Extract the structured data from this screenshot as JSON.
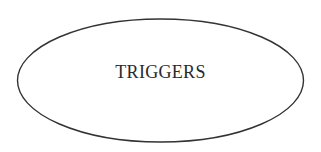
{
  "diagram": {
    "nodes": [
      {
        "id": "triggers",
        "shape": "ellipse",
        "label": "TRIGGERS",
        "stroke_color": "#333333",
        "fill_color": "#ffffff"
      }
    ]
  }
}
